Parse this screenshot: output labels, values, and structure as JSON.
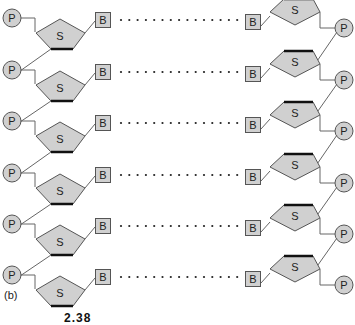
{
  "figure": {
    "panel_label": "(b)",
    "caption_partial": "2.38",
    "colors": {
      "fill": "#d0d0d0",
      "stroke": "#555555",
      "thick_edge": "#111111",
      "line": "#666666",
      "dot": "#222222"
    },
    "row_y": [
      18,
      70,
      121,
      173,
      224,
      275
    ],
    "left_strand": {
      "phosphate_label": "P",
      "sugar_label": "S",
      "base_label": "B"
    },
    "right_strand": {
      "phosphate_label": "P",
      "sugar_label": "S",
      "base_label": "B"
    },
    "pairing": {
      "style": "dotted",
      "dot_count": 15
    }
  }
}
